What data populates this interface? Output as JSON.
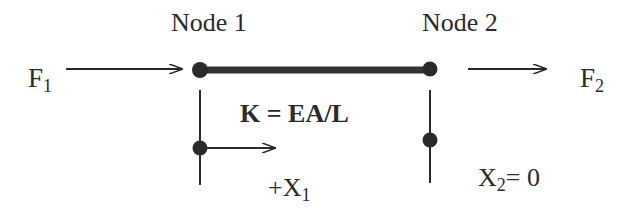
{
  "diagram": {
    "nodes": [
      {
        "label": "Node 1"
      },
      {
        "label": "Node 2"
      }
    ],
    "forces": {
      "left": {
        "main": "F",
        "sub": "1"
      },
      "right": {
        "main": "F",
        "sub": "2"
      }
    },
    "stiffness_label": "K = EA/L",
    "displacements": {
      "node1": {
        "prefix": "+",
        "main": "X",
        "sub": "1",
        "suffix": ""
      },
      "node2": {
        "prefix": "",
        "main": "X",
        "sub": "2",
        "suffix": "= 0"
      }
    },
    "colors": {
      "ink": "#2a2a2a",
      "background": "#ffffff"
    }
  }
}
